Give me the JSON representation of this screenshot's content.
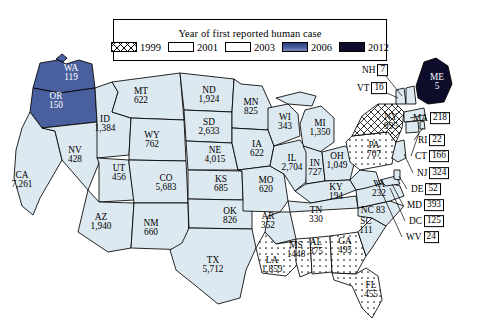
{
  "legend": {
    "title": "Year of first reported human case",
    "items": [
      {
        "label": "1999",
        "pattern": "crosshatch",
        "color": "#ffffff"
      },
      {
        "label": "2001",
        "pattern": "dots",
        "color": "#ffffff"
      },
      {
        "label": "2003",
        "pattern": "solid",
        "color": "#dce9f0"
      },
      {
        "label": "2006",
        "pattern": "solid",
        "color": "#4a5f9e"
      },
      {
        "label": "2012",
        "pattern": "solid",
        "color": "#0d0d2b"
      }
    ]
  },
  "chart_data": {
    "type": "map",
    "title": "Year of first reported human case",
    "categories": [
      "1999",
      "2001",
      "2003",
      "2006",
      "2012"
    ],
    "value_label": "Reported human cases",
    "states": [
      {
        "code": "WA",
        "value": "119",
        "year": "2006",
        "style": "ondark",
        "x": 71,
        "y": 73,
        "label": "inline"
      },
      {
        "code": "OR",
        "value": "150",
        "year": "2006",
        "style": "ondark",
        "x": 56,
        "y": 101,
        "label": "inline"
      },
      {
        "code": "CA",
        "value": "7,261",
        "year": "2003",
        "style": "onwhite",
        "x": 22,
        "y": 180,
        "label": "inline"
      },
      {
        "code": "ID",
        "value": "1,384",
        "year": "2003",
        "style": "onwhite",
        "x": 105,
        "y": 124,
        "label": "inline"
      },
      {
        "code": "NV",
        "value": "428",
        "year": "2003",
        "style": "onwhite",
        "x": 75,
        "y": 155,
        "label": "inline"
      },
      {
        "code": "MT",
        "value": "622",
        "year": "2003",
        "style": "onwhite",
        "x": 141,
        "y": 96,
        "label": "inline"
      },
      {
        "code": "WY",
        "value": "762",
        "year": "2003",
        "style": "onwhite",
        "x": 152,
        "y": 140,
        "label": "inline"
      },
      {
        "code": "UT",
        "value": "456",
        "year": "2003",
        "style": "onwhite",
        "x": 119,
        "y": 173,
        "label": "inline"
      },
      {
        "code": "CO",
        "value": "5,683",
        "year": "2003",
        "style": "onwhite",
        "x": 166,
        "y": 183,
        "label": "inline"
      },
      {
        "code": "AZ",
        "value": "1,940",
        "year": "2003",
        "style": "onwhite",
        "x": 101,
        "y": 222,
        "label": "inline"
      },
      {
        "code": "NM",
        "value": "660",
        "year": "2003",
        "style": "onwhite",
        "x": 151,
        "y": 228,
        "label": "inline"
      },
      {
        "code": "ND",
        "value": "1,924",
        "year": "2003",
        "style": "onwhite",
        "x": 209,
        "y": 95,
        "label": "inline"
      },
      {
        "code": "SD",
        "value": "2,633",
        "year": "2003",
        "style": "onwhite",
        "x": 209,
        "y": 127,
        "label": "inline"
      },
      {
        "code": "NE",
        "value": "4,015",
        "year": "2003",
        "style": "onwhite",
        "x": 215,
        "y": 155,
        "label": "inline"
      },
      {
        "code": "KS",
        "value": "685",
        "year": "2003",
        "style": "onwhite",
        "x": 221,
        "y": 184,
        "label": "inline"
      },
      {
        "code": "OK",
        "value": "826",
        "year": "2003",
        "style": "onwhite",
        "x": 230,
        "y": 216,
        "label": "inline"
      },
      {
        "code": "TX",
        "value": "5,712",
        "year": "2003",
        "style": "onwhite",
        "x": 213,
        "y": 265,
        "label": "inline"
      },
      {
        "code": "MN",
        "value": "825",
        "year": "2003",
        "style": "onwhite",
        "x": 251,
        "y": 107,
        "label": "inline"
      },
      {
        "code": "IA",
        "value": "622",
        "year": "2003",
        "style": "onwhite",
        "x": 257,
        "y": 149,
        "label": "inline"
      },
      {
        "code": "MO",
        "value": "620",
        "year": "2003",
        "style": "onwhite",
        "x": 266,
        "y": 185,
        "label": "inline"
      },
      {
        "code": "AR",
        "value": "352",
        "year": "2003",
        "style": "onwhite",
        "x": 268,
        "y": 221,
        "label": "inline"
      },
      {
        "code": "LA",
        "value": "1,859",
        "year": "2001",
        "style": "onwhite",
        "x": 272,
        "y": 265,
        "label": "inline"
      },
      {
        "code": "MS",
        "value": "1448",
        "year": "2001",
        "style": "onwhite",
        "x": 296,
        "y": 250,
        "label": "inline"
      },
      {
        "code": "WI",
        "value": "343",
        "year": "2003",
        "style": "onwhite",
        "x": 285,
        "y": 122,
        "label": "inline"
      },
      {
        "code": "IL",
        "value": "2,704",
        "year": "2003",
        "style": "onwhite",
        "x": 292,
        "y": 163,
        "label": "inline"
      },
      {
        "code": "MI",
        "value": "1,350",
        "year": "2003",
        "style": "onwhite",
        "x": 320,
        "y": 128,
        "label": "inline"
      },
      {
        "code": "IN",
        "value": "727",
        "year": "2003",
        "style": "onwhite",
        "x": 315,
        "y": 168,
        "label": "inline"
      },
      {
        "code": "OH",
        "value": "1,049",
        "year": "2003",
        "style": "onwhite",
        "x": 337,
        "y": 161,
        "label": "inline"
      },
      {
        "code": "KY",
        "value": "194",
        "year": "2003",
        "style": "onwhite",
        "x": 336,
        "y": 192,
        "label": "inline"
      },
      {
        "code": "TN",
        "value": "330",
        "year": "2003",
        "style": "onwhite",
        "x": 316,
        "y": 215,
        "label": "inline"
      },
      {
        "code": "AL",
        "value": "375",
        "year": "2001",
        "style": "onwhite",
        "x": 316,
        "y": 247,
        "label": "inline"
      },
      {
        "code": "GA",
        "value": "495",
        "year": "2001",
        "style": "onwhite",
        "x": 345,
        "y": 246,
        "label": "inline"
      },
      {
        "code": "FL",
        "value": "455",
        "year": "2001",
        "style": "onwhite",
        "x": 371,
        "y": 290,
        "label": "inline"
      },
      {
        "code": "SC",
        "value": "111",
        "year": "2003",
        "style": "onwhite",
        "x": 366,
        "y": 226,
        "label": "inline"
      },
      {
        "code": "NC",
        "value": "83",
        "year": "2003",
        "style": "onwhite",
        "x": 373,
        "y": 211,
        "label": "nc-inline"
      },
      {
        "code": "VA",
        "value": "232",
        "year": "2003",
        "style": "onwhite",
        "x": 379,
        "y": 189,
        "label": "inline"
      },
      {
        "code": "PA",
        "value": "707",
        "year": "2001",
        "style": "onwhite",
        "x": 374,
        "y": 150,
        "label": "inline"
      },
      {
        "code": "NY",
        "value": "995",
        "year": "1999",
        "style": "onwhite",
        "x": 391,
        "y": 122,
        "label": "inline"
      },
      {
        "code": "ME",
        "value": "5",
        "year": "2012",
        "style": "ondark",
        "x": 437,
        "y": 82,
        "label": "inline"
      }
    ],
    "callouts": [
      {
        "code": "NH",
        "value": "7",
        "year": "2003",
        "x": 362,
        "y": 70,
        "align": "left"
      },
      {
        "code": "VT",
        "value": "16",
        "year": "2003",
        "x": 357,
        "y": 88,
        "align": "left"
      },
      {
        "code": "MA",
        "value": "218",
        "year": "2003",
        "x": 413,
        "y": 118,
        "align": "left"
      },
      {
        "code": "RI",
        "value": "22",
        "year": "2003",
        "x": 418,
        "y": 140,
        "align": "left"
      },
      {
        "code": "CT",
        "value": "166",
        "year": "2003",
        "x": 415,
        "y": 156,
        "align": "left"
      },
      {
        "code": "NJ",
        "value": "324",
        "year": "2003",
        "x": 417,
        "y": 173,
        "align": "left"
      },
      {
        "code": "DE",
        "value": "52",
        "year": "2003",
        "x": 411,
        "y": 189,
        "align": "left"
      },
      {
        "code": "MD",
        "value": "393",
        "year": "2003",
        "x": 407,
        "y": 205,
        "align": "left"
      },
      {
        "code": "DC",
        "value": "125",
        "year": "2003",
        "x": 409,
        "y": 221,
        "align": "left"
      },
      {
        "code": "WV",
        "value": "24",
        "year": "2003",
        "x": 406,
        "y": 237,
        "align": "left"
      }
    ]
  }
}
